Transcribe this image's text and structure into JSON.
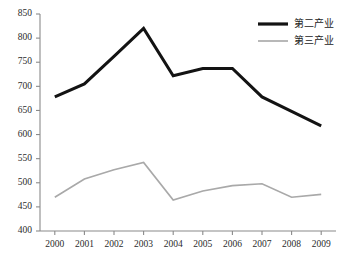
{
  "chart_data": {
    "type": "line",
    "title": "",
    "xlabel": "",
    "ylabel": "",
    "categories": [
      "2000",
      "2001",
      "2002",
      "2003",
      "2004",
      "2005",
      "2006",
      "2007",
      "2008",
      "2009"
    ],
    "ylim": [
      400,
      850
    ],
    "ytick_labels": [
      "850",
      "800",
      "750",
      "700",
      "650",
      "600",
      "550",
      "500",
      "450",
      "400"
    ],
    "ytick_values": [
      850,
      800,
      750,
      700,
      650,
      600,
      550,
      500,
      450,
      400
    ],
    "grid": false,
    "legend_position": "top-right",
    "series": [
      {
        "name": "第二产业",
        "color": "#131313",
        "values": [
          678,
          705,
          762,
          820,
          722,
          737,
          737,
          678,
          648,
          618
        ]
      },
      {
        "name": "第三产业",
        "color": "#a9a9a9",
        "values": [
          470,
          508,
          527,
          542,
          464,
          483,
          494,
          498,
          470,
          476
        ]
      }
    ]
  },
  "legend": {
    "items": [
      {
        "label": "第二产业",
        "swatch": "line-swatch-black"
      },
      {
        "label": "第三产业",
        "swatch": "line-swatch-gray"
      }
    ]
  }
}
